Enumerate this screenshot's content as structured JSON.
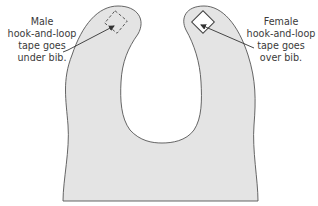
{
  "diagram": {
    "colors": {
      "bib_fill": "#e4e4e4",
      "outline": "#555555",
      "text": "#3a3a3a",
      "arrow": "#333333"
    },
    "labels": {
      "male": {
        "lines": [
          "Male",
          "hook-and-loop",
          "tape goes",
          "under bib."
        ]
      },
      "female": {
        "lines": [
          "Female",
          "hook-and-loop",
          "tape goes",
          "over bib."
        ]
      }
    },
    "markers": {
      "male_patch": "dashed-square-icon",
      "female_patch": "solid-square-icon"
    }
  }
}
